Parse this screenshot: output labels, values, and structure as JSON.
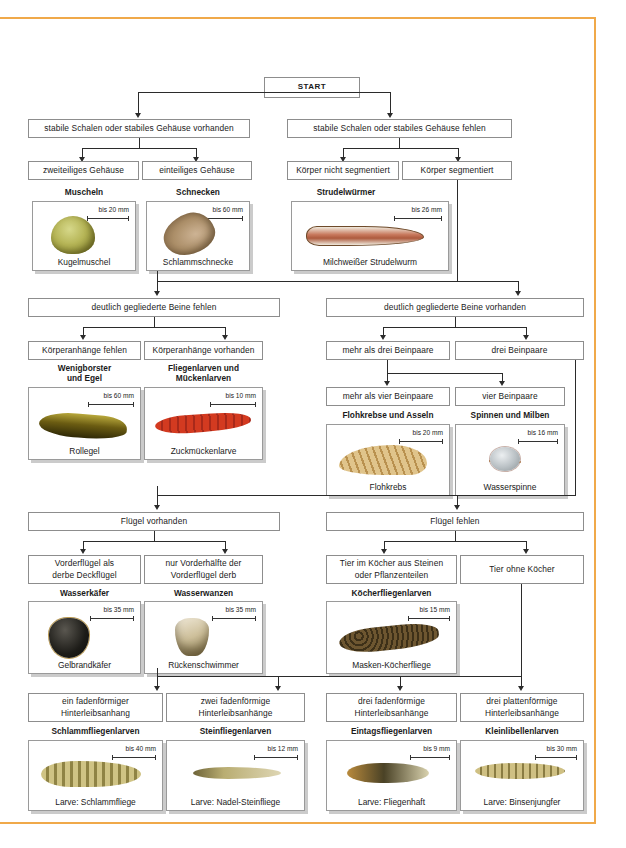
{
  "colors": {
    "frame": "#f0a94a",
    "box_border": "#8d8d8d",
    "line": "#2b2b2b",
    "text": "#1a1a1a"
  },
  "start": {
    "label": "START"
  },
  "level1": [
    {
      "label": "stabile Schalen oder stabiles Gehäuse vorhanden"
    },
    {
      "label": "stabile Schalen oder stabiles Gehäuse fehlen"
    }
  ],
  "level2": [
    {
      "label": "zweiteiliges Gehäuse"
    },
    {
      "label": "einteiliges Gehäuse"
    },
    {
      "label": "Körper nicht segmentiert"
    },
    {
      "label": "Körper segmentiert"
    }
  ],
  "group1": [
    {
      "caption": "Muscheln",
      "scale": "bis 20 mm",
      "name": "Kugelmuschel"
    },
    {
      "caption": "Schnecken",
      "scale": "bis 60 mm",
      "name": "Schlammschnecke"
    },
    {
      "caption": "Strudelwürmer",
      "scale": "bis 26 mm",
      "name": "Milchweißer Strudelwurm"
    }
  ],
  "level3": [
    {
      "label": "deutlich gegliederte Beine fehlen"
    },
    {
      "label": "deutlich gegliederte Beine vorhanden"
    }
  ],
  "level4": [
    {
      "label": "Körperanhänge fehlen"
    },
    {
      "label": "Körperanhänge vorhanden"
    },
    {
      "label": "mehr als drei Beinpaare"
    },
    {
      "label": "drei Beinpaare"
    }
  ],
  "level4b": [
    {
      "label": "mehr als vier Beinpaare"
    },
    {
      "label": "vier Beinpaare"
    }
  ],
  "group2": [
    {
      "caption": "Wenigborster\nund Egel",
      "scale": "bis 60 mm",
      "name": "Rollegel"
    },
    {
      "caption": "Fliegenlarven und\nMückenlarven",
      "scale": "bis 10 mm",
      "name": "Zuckmückenlarve"
    },
    {
      "caption": "Flohkrebse und Asseln",
      "scale": "bis 20 mm",
      "name": "Flohkrebs"
    },
    {
      "caption": "Spinnen und Milben",
      "scale": "bis 16 mm",
      "name": "Wasserspinne"
    }
  ],
  "level5": [
    {
      "label": "Flügel vorhanden"
    },
    {
      "label": "Flügel fehlen"
    }
  ],
  "level6": [
    {
      "label": "Vorderflügel als\nderbe Deckflügel"
    },
    {
      "label": "nur Vorderhälfte der\nVorderflügel derb"
    },
    {
      "label": "Tier im Köcher aus Steinen\noder Pflanzenteilen"
    },
    {
      "label": "Tier ohne Köcher"
    }
  ],
  "group3": [
    {
      "caption": "Wasserkäfer",
      "scale": "bis 35 mm",
      "name": "Gelbrandkäfer"
    },
    {
      "caption": "Wasserwanzen",
      "scale": "bis 35 mm",
      "name": "Rückenschwimmer"
    },
    {
      "caption": "Köcherfliegenlarven",
      "scale": "bis 15 mm",
      "name": "Masken-Köcherfliege"
    }
  ],
  "level7": [
    {
      "label": "ein fadenförmiger\nHinterleibsanhang"
    },
    {
      "label": "zwei fadenförmige\nHinterleibsanhänge"
    },
    {
      "label": "drei fadenförmige\nHinterleibsanhänge"
    },
    {
      "label": "drei plattenförmige\nHinterleibsanhänge"
    }
  ],
  "group4": [
    {
      "caption": "Schlammfliegenlarven",
      "scale": "bis 40 mm",
      "name": "Larve: Schlammfliege"
    },
    {
      "caption": "Steinfliegenlarven",
      "scale": "bis 12 mm",
      "name": "Larve: Nadel-Steinfliege"
    },
    {
      "caption": "Eintagsfliegenlarven",
      "scale": "bis 9 mm",
      "name": "Larve: Fliegenhaft"
    },
    {
      "caption": "Kleinlibellenlarven",
      "scale": "bis 30 mm",
      "name": "Larve: Binsenjungfer"
    }
  ]
}
